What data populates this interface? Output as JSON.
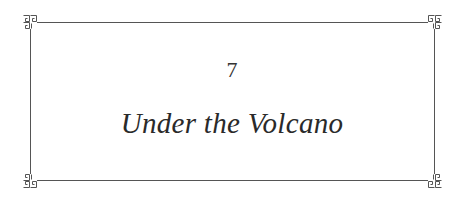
{
  "chapter": {
    "number": "7",
    "title": "Under the Volcano"
  },
  "frame": {
    "style": "thin ruled border with Greek-key (meander) corner ornaments",
    "line_color": "#555555",
    "corners": [
      "top-left-ornament",
      "top-right-ornament",
      "bottom-left-ornament",
      "bottom-right-ornament"
    ]
  }
}
